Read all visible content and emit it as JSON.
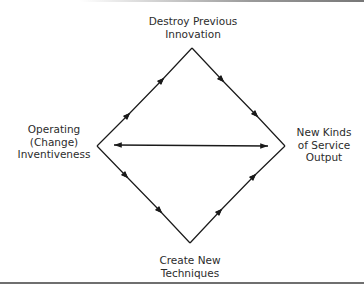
{
  "diagram": {
    "nodes": {
      "top": {
        "lines": [
          "Destroy Previous",
          "Innovation"
        ]
      },
      "left": {
        "lines": [
          "Operating",
          "(Change)",
          "Inventiveness"
        ]
      },
      "right": {
        "lines": [
          "New Kinds",
          "of Service",
          "Output"
        ]
      },
      "bottom": {
        "lines": [
          "Create New",
          "Techniques"
        ]
      }
    },
    "edges": [
      {
        "from": "left",
        "to": "top",
        "arrows": 2
      },
      {
        "from": "top",
        "to": "right",
        "arrows": 2
      },
      {
        "from": "left",
        "to": "bottom",
        "arrows": 2
      },
      {
        "from": "bottom",
        "to": "right",
        "arrows": 2
      },
      {
        "from": "left",
        "to": "right",
        "type": "bidirectional"
      }
    ],
    "line_color": "#1a1a1a",
    "rule_color": "#6f6f6f"
  }
}
